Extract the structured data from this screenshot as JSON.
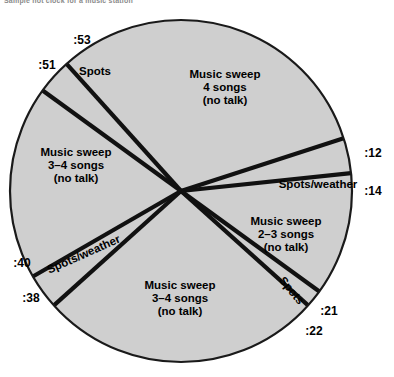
{
  "caption": "Sample hot clock for a music station",
  "chart_data": {
    "type": "pie",
    "title": "Sample hot clock for a music station",
    "subtitle": "",
    "xlabel": "",
    "ylabel": "",
    "legend_position": "none",
    "grid": false,
    "note": "Radio hot-clock: a 60-minute wheel. Boundaries are clock minute marks; each wedge is a programming element.",
    "units": "minutes past the hour",
    "total": 60,
    "center": {
      "x": 181,
      "y": 191
    },
    "radius": 171,
    "fill_color": "#cfcfcf",
    "line_color": "#111111",
    "tick_labels": [
      ":53",
      ":51",
      ":12",
      ":14",
      ":21",
      ":22",
      ":38",
      ":40"
    ],
    "categories": [
      "Music sweep 4 songs (no talk)",
      "Spots/weather",
      "Music sweep 2-3 songs (no talk)",
      "Spots",
      "Music sweep 3-4 songs (no talk)",
      "Spots/weather",
      "Music sweep 3-4 songs (no talk)",
      "Spots"
    ],
    "values": [
      19,
      2,
      7,
      1,
      16,
      2,
      11,
      2
    ],
    "slices": [
      {
        "index": 0,
        "label": "Music sweep\n4 songs\n(no talk)",
        "label_lines": [
          "Music sweep",
          "4 songs",
          "(no talk)"
        ],
        "start_minute": 53,
        "end_minute": 12,
        "duration_minutes": 19,
        "start_tick": ":53",
        "end_tick": ":12",
        "label_x": 225,
        "label_y": 88
      },
      {
        "index": 1,
        "label": "Spots/weather",
        "label_lines": [
          "Spots/weather"
        ],
        "start_minute": 12,
        "end_minute": 14,
        "duration_minutes": 2,
        "start_tick": ":12",
        "end_tick": ":14",
        "label_x": 318,
        "label_y": 185,
        "rotation": 0
      },
      {
        "index": 2,
        "label": "Music sweep\n2-3 songs\n(no talk)",
        "label_lines": [
          "Music sweep",
          "2–3 songs",
          "(no talk)"
        ],
        "start_minute": 14,
        "end_minute": 21,
        "duration_minutes": 7,
        "start_tick": ":14",
        "end_tick": ":21",
        "label_x": 286,
        "label_y": 235
      },
      {
        "index": 3,
        "label": "Spots",
        "label_lines": [
          "Spots"
        ],
        "start_minute": 21,
        "end_minute": 22,
        "duration_minutes": 1,
        "start_tick": ":21",
        "end_tick": ":22",
        "label_x": 291,
        "label_y": 291,
        "rotation": 51
      },
      {
        "index": 4,
        "label": "Music sweep\n3-4 songs\n(no talk)",
        "label_lines": [
          "Music sweep",
          "3–4 songs",
          "(no talk)"
        ],
        "start_minute": 22,
        "end_minute": 38,
        "duration_minutes": 16,
        "start_tick": ":22",
        "end_tick": ":38",
        "label_x": 180,
        "label_y": 299
      },
      {
        "index": 5,
        "label": "Spots/weather",
        "label_lines": [
          "Spots/weather"
        ],
        "start_minute": 38,
        "end_minute": 40,
        "duration_minutes": 2,
        "start_tick": ":38",
        "end_tick": ":40",
        "label_x": 84,
        "label_y": 255,
        "rotation": -24
      },
      {
        "index": 6,
        "label": "Music sweep\n3-4 songs\n(no talk)",
        "label_lines": [
          "Music sweep",
          "3–4 songs",
          "(no talk)"
        ],
        "start_minute": 40,
        "end_minute": 51,
        "duration_minutes": 11,
        "start_tick": ":40",
        "end_tick": ":51",
        "label_x": 76,
        "label_y": 166
      },
      {
        "index": 7,
        "label": "Spots",
        "label_lines": [
          "Spots"
        ],
        "start_minute": 51,
        "end_minute": 53,
        "duration_minutes": 2,
        "start_tick": ":51",
        "end_tick": ":53",
        "label_x": 95,
        "label_y": 72,
        "rotation": 0
      }
    ],
    "tick_marks": [
      {
        "label": ":53",
        "minute": 53,
        "x": 82,
        "y": 41,
        "anchor": "middle"
      },
      {
        "label": ":51",
        "minute": 51,
        "x": 47,
        "y": 66,
        "anchor": "middle"
      },
      {
        "label": ":12",
        "minute": 12,
        "x": 373,
        "y": 154,
        "anchor": "middle"
      },
      {
        "label": ":14",
        "minute": 14,
        "x": 373,
        "y": 192,
        "anchor": "middle"
      },
      {
        "label": ":21",
        "minute": 21,
        "x": 329,
        "y": 312,
        "anchor": "middle"
      },
      {
        "label": ":22",
        "minute": 22,
        "x": 314,
        "y": 332,
        "anchor": "middle"
      },
      {
        "label": ":40",
        "minute": 40,
        "x": 22,
        "y": 264,
        "anchor": "middle"
      },
      {
        "label": ":38",
        "minute": 38,
        "x": 31,
        "y": 299,
        "anchor": "middle"
      }
    ]
  }
}
